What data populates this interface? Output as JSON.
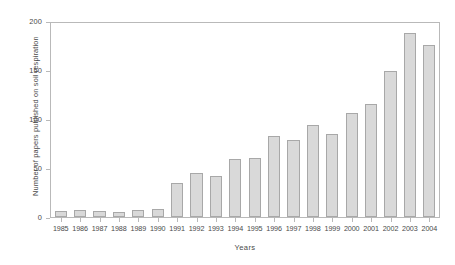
{
  "chart_data": {
    "type": "bar",
    "title": "",
    "xlabel": "Years",
    "ylabel": "Number of papers published on soil respiration",
    "categories": [
      "1985",
      "1986",
      "1987",
      "1988",
      "1989",
      "1990",
      "1991",
      "1992",
      "1993",
      "1994",
      "1995",
      "1996",
      "1997",
      "1998",
      "1999",
      "2000",
      "2001",
      "2002",
      "2003",
      "2004"
    ],
    "values": [
      6,
      7,
      6,
      5,
      7,
      8,
      35,
      45,
      42,
      60,
      61,
      84,
      79,
      95,
      86,
      107,
      117,
      151,
      190,
      177
    ],
    "ylim": [
      0,
      200
    ],
    "yticks": [
      0,
      50,
      100,
      150,
      200
    ],
    "ytick_labels": [
      "0",
      "50",
      "100",
      "150",
      "200"
    ],
    "grid": false,
    "legend": false,
    "bar_color": "#d9d9d9",
    "bar_border_color": "#a8a8a8",
    "axis_color": "#b9b9b9",
    "text_color": "#4a4a4a"
  }
}
